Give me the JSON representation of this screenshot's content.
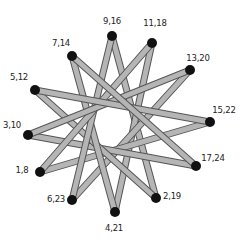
{
  "diagram": {
    "type": "star-linkage",
    "bar_color": "#b5b5b5",
    "bar_edge_color": "#555555",
    "node_color": "#111111",
    "step": 5,
    "nodes": [
      {
        "label": "9,16",
        "x": 112,
        "y": 36,
        "lx": 112,
        "ly": 21
      },
      {
        "label": "11,18",
        "x": 152,
        "y": 43,
        "lx": 155,
        "ly": 23
      },
      {
        "label": "13,20",
        "x": 190,
        "y": 70,
        "lx": 198,
        "ly": 58
      },
      {
        "label": "15,22",
        "x": 210,
        "y": 122,
        "lx": 224,
        "ly": 110
      },
      {
        "label": "17,24",
        "x": 196,
        "y": 166,
        "lx": 213,
        "ly": 158
      },
      {
        "label": "2,19",
        "x": 156,
        "y": 198,
        "lx": 172,
        "ly": 196
      },
      {
        "label": "4,21",
        "x": 115,
        "y": 212,
        "lx": 114,
        "ly": 228
      },
      {
        "label": "6,23",
        "x": 72,
        "y": 200,
        "lx": 56,
        "ly": 199
      },
      {
        "label": "1,8",
        "x": 40,
        "y": 172,
        "lx": 22,
        "ly": 170
      },
      {
        "label": "3,10",
        "x": 28,
        "y": 135,
        "lx": 12,
        "ly": 125
      },
      {
        "label": "5,12",
        "x": 35,
        "y": 90,
        "lx": 19,
        "ly": 77
      },
      {
        "label": "7,14",
        "x": 72,
        "y": 56,
        "lx": 61,
        "ly": 43
      }
    ]
  }
}
